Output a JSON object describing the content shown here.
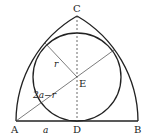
{
  "diagram": {
    "points": {
      "A": {
        "label": "A",
        "x": 16,
        "y": 121
      },
      "B": {
        "label": "B",
        "x": 138,
        "y": 121
      },
      "C": {
        "label": "C",
        "x": 77,
        "y": 16
      },
      "D": {
        "label": "D",
        "x": 77,
        "y": 121
      },
      "E": {
        "label": "E",
        "x": 77,
        "y": 77
      }
    },
    "circle": {
      "cx": 77,
      "cy": 77,
      "r": 44
    },
    "labels": {
      "r": "r",
      "hyp": "2a−r",
      "a": "a"
    },
    "colors": {
      "stroke": "#222222",
      "thin": "#444444"
    }
  }
}
